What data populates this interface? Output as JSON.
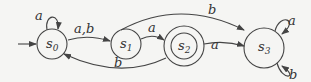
{
  "diagram": {
    "type": "finite-state-automaton",
    "states": [
      {
        "id": "s0",
        "name": "s",
        "sub": "0",
        "start": true,
        "accepting": false
      },
      {
        "id": "s1",
        "name": "s",
        "sub": "1",
        "start": false,
        "accepting": false
      },
      {
        "id": "s2",
        "name": "s",
        "sub": "2",
        "start": false,
        "accepting": true
      },
      {
        "id": "s3",
        "name": "s",
        "sub": "3",
        "start": false,
        "accepting": false
      }
    ],
    "transitions": [
      {
        "from": "s0",
        "to": "s0",
        "label": "a"
      },
      {
        "from": "s0",
        "to": "s1",
        "label": "a,b"
      },
      {
        "from": "s1",
        "to": "s2",
        "label": "a"
      },
      {
        "from": "s1",
        "to": "s3",
        "label": "b"
      },
      {
        "from": "s2",
        "to": "s3",
        "label": "a"
      },
      {
        "from": "s2",
        "to": "s0",
        "label": "b"
      },
      {
        "from": "s3",
        "to": "s3",
        "label": "a"
      },
      {
        "from": "s3",
        "to": "s3",
        "label": "b"
      }
    ]
  }
}
